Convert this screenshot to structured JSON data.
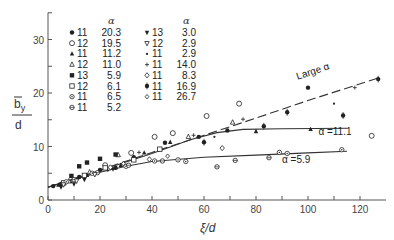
{
  "chart_data": {
    "type": "scatter",
    "title": "",
    "xlabel": "ξ/d",
    "ylabel": "b̄y/d",
    "xlim": [
      0,
      130
    ],
    "ylim": [
      0,
      35
    ],
    "xticks": [
      0,
      20,
      40,
      60,
      80,
      100,
      120
    ],
    "yticks": [
      0,
      10,
      20,
      30
    ],
    "xtick_labels": [
      "0",
      "20",
      "40",
      "60",
      "80",
      "100",
      "120"
    ],
    "ytick_labels": [
      "0",
      "10",
      "20",
      "30"
    ],
    "grid": false,
    "legend": {
      "position": "upper-left",
      "header": "α",
      "entries": [
        {
          "marker": "filled-circle",
          "label": "11",
          "alpha": "20.3"
        },
        {
          "marker": "open-circle",
          "label": "12",
          "alpha": "19.5"
        },
        {
          "marker": "filled-triangle",
          "label": "11",
          "alpha": "11.2"
        },
        {
          "marker": "open-triangle",
          "label": "12",
          "alpha": "11.0"
        },
        {
          "marker": "filled-square",
          "label": "13",
          "alpha": "5.9"
        },
        {
          "marker": "open-square",
          "label": "12",
          "alpha": "6.1"
        },
        {
          "marker": "circle-dot",
          "label": "11",
          "alpha": "6.5"
        },
        {
          "marker": "circle-bar",
          "label": "11",
          "alpha": "5.2"
        },
        {
          "marker": "filled-down-triangle",
          "label": "13",
          "alpha": "3.0"
        },
        {
          "marker": "open-down-triangle",
          "label": "12",
          "alpha": "2.9"
        },
        {
          "marker": "small-dot",
          "label": "11",
          "alpha": "2.9"
        },
        {
          "marker": "plus",
          "label": "11",
          "alpha": "14.0"
        },
        {
          "marker": "open-diamond",
          "label": "11",
          "alpha": "8.3"
        },
        {
          "marker": "filled-star",
          "label": "11",
          "alpha": "16.9"
        },
        {
          "marker": "open-diamond-small",
          "label": "11",
          "alpha": "26.7"
        }
      ]
    },
    "curves": [
      {
        "name": "Large α",
        "style": "dashed",
        "x": [
          0,
          20,
          40,
          60,
          80,
          100,
          127
        ],
        "y": [
          2.4,
          5.6,
          8.9,
          12.1,
          15.3,
          18.6,
          22.8
        ]
      },
      {
        "name": "α=11.1",
        "style": "solid",
        "x": [
          0,
          20,
          40,
          55,
          65,
          75,
          90,
          115
        ],
        "y": [
          2.4,
          5.5,
          8.7,
          11.3,
          12.6,
          13.2,
          13.3,
          13.4
        ]
      },
      {
        "name": "α=5.9",
        "style": "solid",
        "x": [
          0,
          10,
          20,
          30,
          40,
          60,
          80,
          100,
          115
        ],
        "y": [
          2.4,
          3.9,
          5.2,
          6.3,
          7.2,
          8.0,
          8.4,
          8.8,
          9.1
        ]
      }
    ],
    "annotations": [
      {
        "text": "Large α",
        "x": 96,
        "y": 22.5,
        "rotation": -18
      },
      {
        "text": "α =11.1",
        "x": 104,
        "y": 12.2
      },
      {
        "text": "α =5.9",
        "x": 90,
        "y": 7.0
      }
    ],
    "series": [
      {
        "name": "11, α=20.3",
        "marker": "filled-circle",
        "points": [
          [
            2,
            2.6
          ],
          [
            5,
            3.0
          ],
          [
            12,
            4.3
          ],
          [
            20,
            5.6
          ],
          [
            26,
            6.0
          ],
          [
            33,
            8.0
          ],
          [
            45,
            10.7
          ],
          [
            58,
            11.8
          ],
          [
            69,
            13.0
          ],
          [
            100,
            21.0
          ]
        ]
      },
      {
        "name": "12, α=19.5",
        "marker": "open-circle",
        "points": [
          [
            32,
            8.8
          ],
          [
            41,
            11.8
          ],
          [
            48,
            12.5
          ],
          [
            61,
            15.7
          ],
          [
            73.5,
            18.0
          ],
          [
            124.5,
            12.0
          ],
          [
            22,
            6.5
          ]
        ]
      },
      {
        "name": "11, α=11.2",
        "marker": "filled-triangle",
        "points": [
          [
            4,
            2.8
          ],
          [
            15,
            4.6
          ],
          [
            28,
            6.5
          ],
          [
            37,
            8.8
          ],
          [
            47,
            10.8
          ],
          [
            80,
            12.8
          ],
          [
            101,
            13.2
          ]
        ]
      },
      {
        "name": "12, α=11.0",
        "marker": "open-triangle",
        "points": [
          [
            8,
            3.5
          ],
          [
            16,
            5.2
          ],
          [
            27,
            8.4
          ],
          [
            54,
            11.8
          ],
          [
            71,
            14.5
          ]
        ]
      },
      {
        "name": "13, α=5.9",
        "marker": "filled-square",
        "points": [
          [
            9,
            4.5
          ],
          [
            12,
            6.3
          ],
          [
            15,
            7.0
          ],
          [
            20,
            7.7
          ],
          [
            26,
            8.5
          ]
        ]
      },
      {
        "name": "12, α=6.1",
        "marker": "open-square",
        "points": [
          [
            6,
            3.2
          ],
          [
            14,
            4.6
          ],
          [
            22,
            6.0
          ],
          [
            33,
            7.5
          ],
          [
            43,
            9.5
          ]
        ]
      },
      {
        "name": "11, α=6.5",
        "marker": "circle-dot",
        "points": [
          [
            7,
            3.4
          ],
          [
            17,
            5.0
          ],
          [
            30,
            6.3
          ],
          [
            41,
            7.3
          ],
          [
            50,
            7.5
          ],
          [
            53,
            7.2
          ],
          [
            89,
            8.9
          ],
          [
            92,
            8.7
          ],
          [
            113,
            9.4
          ]
        ]
      },
      {
        "name": "11, α=5.2",
        "marker": "circle-bar",
        "points": [
          [
            10,
            3.8
          ],
          [
            19,
            5.1
          ],
          [
            31,
            6.5
          ],
          [
            44,
            7.3
          ],
          [
            65,
            6.2
          ],
          [
            72,
            7.4
          ],
          [
            85,
            7.9
          ]
        ]
      },
      {
        "name": "13, α=3.0",
        "marker": "filled-down-triangle",
        "points": [
          [
            5,
            2.4
          ],
          [
            10,
            3.0
          ],
          [
            14,
            3.8
          ],
          [
            25,
            5.8
          ]
        ]
      },
      {
        "name": "12, α=2.9",
        "marker": "open-down-triangle",
        "points": [
          [
            6,
            2.9
          ],
          [
            11,
            3.6
          ],
          [
            18,
            4.8
          ]
        ]
      },
      {
        "name": "11, α=2.9",
        "marker": "small-dot",
        "points": [
          [
            9,
            3.3
          ],
          [
            23,
            5.5
          ],
          [
            64,
            11.8
          ],
          [
            110,
            18.0
          ]
        ]
      },
      {
        "name": "11, α=14.0",
        "marker": "plus",
        "points": [
          [
            35,
            8.9
          ],
          [
            56,
            12.1
          ],
          [
            75,
            15.1
          ],
          [
            118,
            21.0
          ]
        ]
      },
      {
        "name": "11, α=8.3",
        "marker": "open-diamond",
        "points": [
          [
            24,
            6.1
          ],
          [
            39,
            7.6
          ],
          [
            67,
            9.7
          ]
        ]
      },
      {
        "name": "11, α=16.9",
        "marker": "filled-star",
        "points": [
          [
            60,
            10.8
          ],
          [
            83,
            13.8
          ],
          [
            113.5,
            15.8
          ],
          [
            127,
            22.6
          ],
          [
            92,
            16.4
          ]
        ]
      },
      {
        "name": "11, α=26.7",
        "marker": "open-diamond-small",
        "points": [
          [
            29,
            6.8
          ],
          [
            46,
            8.2
          ]
        ]
      }
    ]
  }
}
